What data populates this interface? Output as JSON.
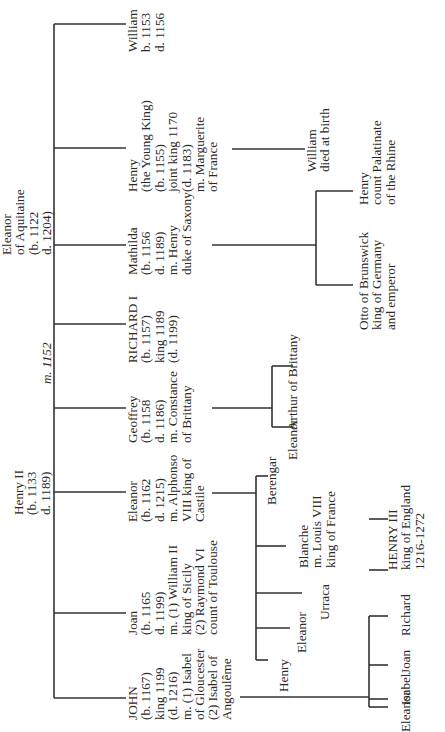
{
  "parents": {
    "father": {
      "lines": [
        "Henry II",
        "(b. 1133",
        "d. 1189)"
      ]
    },
    "mother": {
      "lines": [
        "Eleanor",
        "of Aquitaine",
        "(b. 1122",
        "d. 1204)"
      ]
    },
    "marriage": "m. 1152"
  },
  "children": [
    {
      "id": "william",
      "lines": [
        "William",
        "b. 1153",
        "d. 1156"
      ]
    },
    {
      "id": "henry_young_king",
      "lines": [
        "Henry",
        "(the Young King)",
        "(b. 1155)",
        "joint king 1170",
        "(d. 1183)",
        "m. Marguerite",
        "of France"
      ]
    },
    {
      "id": "mathilda",
      "lines": [
        "Mathilda",
        "(b. 1156",
        "d. 1189)",
        "m. Henry",
        "duke of Saxony"
      ]
    },
    {
      "id": "richard",
      "lines": [
        "RICHARD I",
        "(b. 1157)",
        "king 1189",
        "(d. 1199)"
      ]
    },
    {
      "id": "geoffrey",
      "lines": [
        "Geoffrey",
        "(b. 1158",
        "d. 1186)",
        "m. Constance",
        "of Brittany"
      ]
    },
    {
      "id": "eleanor",
      "lines": [
        "Eleanor",
        "(b. 1162",
        "d. 1215)",
        "m. Alphonso",
        "VIII king of",
        "Castile"
      ]
    },
    {
      "id": "joan",
      "lines": [
        "Joan",
        "(b. 1165",
        "d. 1199)",
        "m. (1) William II",
        "king of Sicily",
        "(2) Raymond VI",
        "count of Toulouse"
      ]
    },
    {
      "id": "john",
      "lines": [
        "JOHN",
        "(b. 1167)",
        "king 1199",
        "(d. 1216)",
        "m. (1) Isabel",
        "of Gloucester",
        "(2) Isabel of",
        "Angoulême"
      ]
    }
  ],
  "grandchildren": {
    "henry_young_king": [
      {
        "lines": [
          "William",
          "died at birth"
        ]
      }
    ],
    "mathilda": [
      {
        "lines": [
          "Henry",
          "count Palatinate",
          "of the Rhine"
        ]
      },
      {
        "lines": [
          "Otto of Brunswick",
          "king of Germany",
          "and emperor"
        ]
      }
    ],
    "geoffrey": [
      {
        "lines": [
          "Arthur of Brittany"
        ]
      },
      {
        "lines": [
          "Eleanor"
        ]
      }
    ],
    "eleanor": [
      {
        "lines": [
          "Berengar"
        ]
      },
      {
        "lines": [
          "Blanche",
          "m. Louis VIII",
          "king of France"
        ]
      },
      {
        "lines": [
          "Urraca"
        ]
      },
      {
        "lines": [
          "Eleanor"
        ]
      },
      {
        "lines": [
          "Henry"
        ]
      }
    ],
    "john": [
      {
        "lines": [
          "HENRY III",
          "king of England",
          "1216-1272"
        ]
      },
      {
        "lines": [
          "Richard"
        ]
      },
      {
        "lines": [
          "Joan"
        ]
      },
      {
        "lines": [
          "Isabel"
        ]
      },
      {
        "lines": [
          "Eleanor"
        ]
      }
    ]
  }
}
